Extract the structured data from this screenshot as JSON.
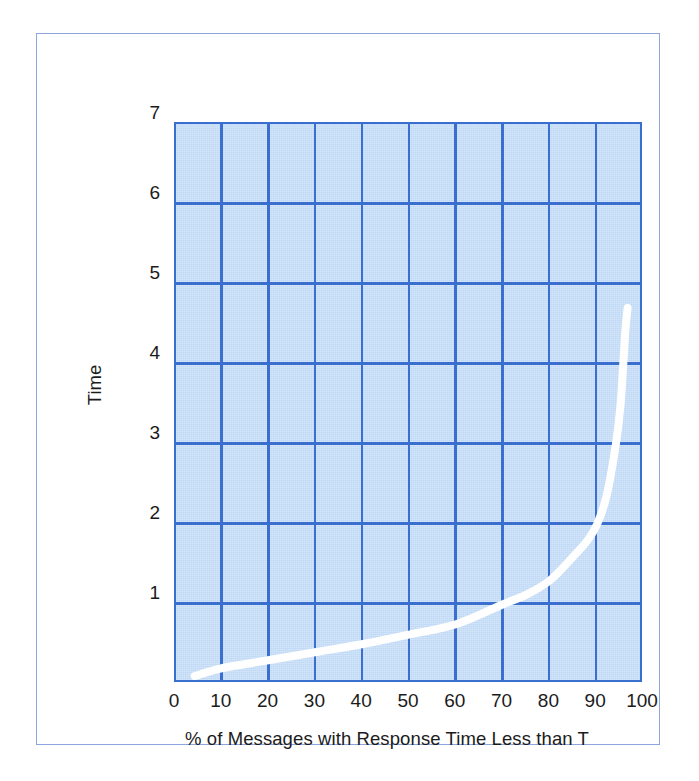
{
  "figure": {
    "frame_color": "#8da6e0",
    "plot_background": "#bfd8f5",
    "grid_color": "#3a6fd0",
    "curve_color": "#ffffff",
    "text_color": "#1b1b1b"
  },
  "chart_data": {
    "type": "line",
    "title": "",
    "xlabel": "% of Messages with Response Time Less than T",
    "ylabel": "Time",
    "xlim": [
      0,
      100
    ],
    "ylim": [
      0,
      7
    ],
    "xticks": [
      "0",
      "10",
      "20",
      "30",
      "40",
      "50",
      "60",
      "70",
      "80",
      "90",
      "100"
    ],
    "yticks": [
      "1",
      "2",
      "3",
      "4",
      "5",
      "6",
      "7"
    ],
    "grid": true,
    "legend": null,
    "series": [
      {
        "name": "Response time distribution",
        "color": "#ffffff",
        "x": [
          4,
          10,
          20,
          30,
          40,
          50,
          60,
          70,
          75,
          80,
          85,
          88,
          90,
          92,
          94,
          95,
          96,
          96.5
        ],
        "y": [
          0.1,
          0.2,
          0.3,
          0.4,
          0.5,
          0.62,
          0.75,
          1.0,
          1.12,
          1.3,
          1.6,
          1.8,
          2.0,
          2.35,
          3.0,
          3.5,
          4.4,
          4.7
        ]
      }
    ]
  }
}
